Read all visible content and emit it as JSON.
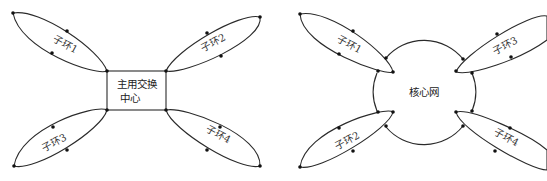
{
  "left_diagram": {
    "center_label_line1": "主用交换",
    "center_label_line2": "中心",
    "rings": [
      {
        "label": "子环1"
      },
      {
        "label": "子环2"
      },
      {
        "label": "子环3"
      },
      {
        "label": "子环4"
      }
    ]
  },
  "right_diagram": {
    "center_label": "核心网",
    "rings": [
      {
        "label": "子环1"
      },
      {
        "label": "子环2"
      },
      {
        "label": "子环3"
      },
      {
        "label": "子环4"
      }
    ]
  },
  "colors": {
    "stroke": "#2a2a2a",
    "node": "#111111",
    "text": "#333333",
    "background": "#ffffff"
  }
}
